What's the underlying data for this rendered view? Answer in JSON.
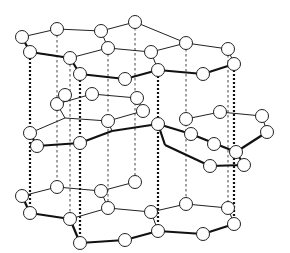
{
  "diagram": {
    "colors": {
      "line": "#222222",
      "atom_fill": "#ffffff",
      "background": "#ffffff"
    },
    "atom_radius": 6.5,
    "layers": [
      {
        "name": "top-layer",
        "atoms": [
          [
            22,
            37
          ],
          [
            30,
            52
          ],
          [
            57,
            29
          ],
          [
            70,
            58
          ],
          [
            80,
            74
          ],
          [
            101,
            31
          ],
          [
            108,
            48
          ],
          [
            125,
            79
          ],
          [
            135,
            22
          ],
          [
            151,
            52
          ],
          [
            158,
            70
          ],
          [
            186,
            43
          ],
          [
            203,
            74
          ],
          [
            228,
            49
          ],
          [
            234,
            64
          ]
        ],
        "thin_bonds": [
          [
            [
              22,
              37
            ],
            [
              57,
              29
            ]
          ],
          [
            [
              57,
              29
            ],
            [
              101,
              31
            ]
          ],
          [
            [
              101,
              31
            ],
            [
              135,
              22
            ]
          ],
          [
            [
              135,
              22
            ],
            [
              186,
              43
            ]
          ],
          [
            [
              186,
              43
            ],
            [
              228,
              49
            ]
          ],
          [
            [
              228,
              49
            ],
            [
              234,
              64
            ]
          ],
          [
            [
              30,
              52
            ],
            [
              70,
              58
            ]
          ],
          [
            [
              101,
              31
            ],
            [
              108,
              48
            ]
          ],
          [
            [
              108,
              48
            ],
            [
              70,
              58
            ]
          ],
          [
            [
              108,
              48
            ],
            [
              151,
              52
            ]
          ],
          [
            [
              151,
              52
            ],
            [
              186,
              43
            ]
          ],
          [
            [
              151,
              52
            ],
            [
              158,
              70
            ]
          ]
        ],
        "thick_bonds": [
          [
            [
              22,
              37
            ],
            [
              30,
              52
            ]
          ],
          [
            [
              30,
              52
            ],
            [
              70,
              58
            ]
          ],
          [
            [
              70,
              58
            ],
            [
              80,
              74
            ]
          ],
          [
            [
              80,
              74
            ],
            [
              125,
              79
            ]
          ],
          [
            [
              125,
              79
            ],
            [
              158,
              70
            ]
          ],
          [
            [
              158,
              70
            ],
            [
              203,
              74
            ]
          ],
          [
            [
              203,
              74
            ],
            [
              234,
              64
            ]
          ]
        ]
      },
      {
        "name": "middle-layer",
        "atoms": [
          [
            57,
            104
          ],
          [
            30,
            133
          ],
          [
            37,
            146
          ],
          [
            65,
            95
          ],
          [
            92,
            94
          ],
          [
            80,
            143
          ],
          [
            108,
            121
          ],
          [
            137,
            98
          ],
          [
            143,
            111
          ],
          [
            158,
            124
          ],
          [
            186,
            119
          ],
          [
            191,
            134
          ],
          [
            214,
            144
          ],
          [
            220,
            112
          ],
          [
            262,
            116
          ],
          [
            267,
            132
          ],
          [
            236,
            152
          ],
          [
            244,
            165
          ],
          [
            210,
            166
          ]
        ],
        "thin_bonds": [
          [
            [
              57,
              104
            ],
            [
              92,
              94
            ]
          ],
          [
            [
              92,
              94
            ],
            [
              137,
              98
            ]
          ],
          [
            [
              137,
              98
            ],
            [
              143,
              111
            ]
          ],
          [
            [
              57,
              104
            ],
            [
              65,
              118
            ]
          ],
          [
            [
              30,
              133
            ],
            [
              65,
              118
            ]
          ],
          [
            [
              65,
              118
            ],
            [
              108,
              121
            ]
          ],
          [
            [
              108,
              121
            ],
            [
              143,
              111
            ]
          ],
          [
            [
              186,
              119
            ],
            [
              220,
              112
            ]
          ],
          [
            [
              220,
              112
            ],
            [
              262,
              116
            ]
          ],
          [
            [
              262,
              116
            ],
            [
              267,
              132
            ]
          ],
          [
            [
              108,
              121
            ],
            [
              112,
              131
            ]
          ]
        ],
        "thick_bonds": [
          [
            [
              30,
              133
            ],
            [
              37,
              146
            ]
          ],
          [
            [
              37,
              146
            ],
            [
              80,
              143
            ]
          ],
          [
            [
              80,
              143
            ],
            [
              112,
              131
            ]
          ],
          [
            [
              112,
              131
            ],
            [
              158,
              124
            ]
          ],
          [
            [
              158,
              124
            ],
            [
              191,
              134
            ]
          ],
          [
            [
              191,
              134
            ],
            [
              236,
              152
            ]
          ],
          [
            [
              236,
              152
            ],
            [
              267,
              132
            ]
          ],
          [
            [
              158,
              124
            ],
            [
              165,
              145
            ]
          ],
          [
            [
              165,
              145
            ],
            [
              210,
              166
            ]
          ],
          [
            [
              210,
              166
            ],
            [
              244,
              165
            ]
          ],
          [
            [
              244,
              165
            ],
            [
              236,
              152
            ]
          ]
        ]
      },
      {
        "name": "bottom-layer",
        "atoms": [
          [
            22,
            196
          ],
          [
            30,
            213
          ],
          [
            57,
            187
          ],
          [
            70,
            219
          ],
          [
            80,
            243
          ],
          [
            101,
            191
          ],
          [
            108,
            208
          ],
          [
            125,
            240
          ],
          [
            135,
            182
          ],
          [
            151,
            212
          ],
          [
            158,
            231
          ],
          [
            186,
            204
          ],
          [
            203,
            234
          ],
          [
            228,
            208
          ],
          [
            234,
            224
          ]
        ],
        "thin_bonds": [
          [
            [
              22,
              196
            ],
            [
              57,
              187
            ]
          ],
          [
            [
              57,
              187
            ],
            [
              101,
              191
            ]
          ],
          [
            [
              101,
              191
            ],
            [
              135,
              182
            ]
          ],
          [
            [
              101,
              191
            ],
            [
              108,
              208
            ]
          ],
          [
            [
              108,
              208
            ],
            [
              70,
              219
            ]
          ],
          [
            [
              108,
              208
            ],
            [
              151,
              212
            ]
          ],
          [
            [
              151,
              212
            ],
            [
              186,
              204
            ]
          ],
          [
            [
              186,
              204
            ],
            [
              228,
              208
            ]
          ],
          [
            [
              228,
              208
            ],
            [
              234,
              224
            ]
          ],
          [
            [
              151,
              212
            ],
            [
              158,
              231
            ]
          ]
        ],
        "thick_bonds": [
          [
            [
              22,
              196
            ],
            [
              30,
              213
            ]
          ],
          [
            [
              30,
              213
            ],
            [
              70,
              219
            ]
          ],
          [
            [
              70,
              219
            ],
            [
              80,
              243
            ]
          ],
          [
            [
              80,
              243
            ],
            [
              125,
              240
            ]
          ],
          [
            [
              125,
              240
            ],
            [
              158,
              231
            ]
          ],
          [
            [
              158,
              231
            ],
            [
              203,
              234
            ]
          ],
          [
            [
              203,
              234
            ],
            [
              234,
              224
            ]
          ]
        ]
      }
    ],
    "interlayer_links": {
      "thick": [
        [
          [
            30,
            58
          ],
          [
            30,
            207
          ]
        ],
        [
          [
            80,
            80
          ],
          [
            80,
            237
          ]
        ],
        [
          [
            158,
            76
          ],
          [
            158,
            225
          ]
        ],
        [
          [
            234,
            70
          ],
          [
            234,
            218
          ]
        ]
      ],
      "thin": [
        [
          [
            57,
            35
          ],
          [
            57,
            181
          ]
        ],
        [
          [
            108,
            54
          ],
          [
            108,
            202
          ]
        ],
        [
          [
            135,
            28
          ],
          [
            135,
            176
          ]
        ],
        [
          [
            186,
            49
          ],
          [
            186,
            198
          ]
        ],
        [
          [
            228,
            55
          ],
          [
            228,
            202
          ]
        ],
        [
          [
            70,
            64
          ],
          [
            70,
            213
          ]
        ]
      ]
    }
  }
}
